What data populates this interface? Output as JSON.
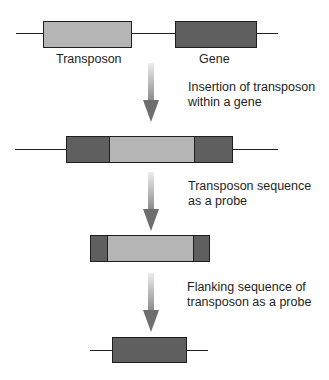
{
  "colors": {
    "transposon": "#b5b5b5",
    "gene": "#5f5f5f",
    "outline": "#1e1e1e",
    "arrow_top": "#e6e6e6",
    "arrow_bottom": "#6e6e6e"
  },
  "row1": {
    "transposon_label": "Transposon",
    "gene_label": "Gene"
  },
  "steps": [
    {
      "line1": "Insertion of transposon",
      "line2": "within a gene"
    },
    {
      "line1": "Transposon sequence",
      "line2": "as a probe"
    },
    {
      "line1": "Flanking  sequence of",
      "line2": "transposon as a probe"
    }
  ]
}
